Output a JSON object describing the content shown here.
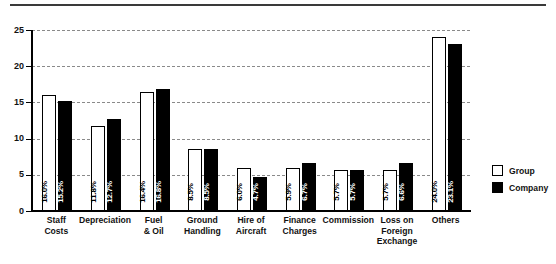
{
  "chart_data": {
    "type": "bar",
    "title": "",
    "subtitle": "",
    "xlabel": "",
    "ylabel": "",
    "ylim": [
      0,
      25
    ],
    "yticks": [
      0,
      5,
      10,
      15,
      20,
      25
    ],
    "grid": true,
    "legend_position": "right",
    "categories": [
      "Staff Costs",
      "Depreciation",
      "Fuel & Oil",
      "Ground Handling",
      "Hire of Aircraft",
      "Finance Charges",
      "Commission",
      "Loss on Foreign Exchange",
      "Others"
    ],
    "category_lines": [
      [
        "Staff",
        "Costs"
      ],
      [
        "Depreciation"
      ],
      [
        "Fuel",
        "& Oil"
      ],
      [
        "Ground",
        "Handling"
      ],
      [
        "Hire of",
        "Aircraft"
      ],
      [
        "Finance",
        "Charges"
      ],
      [
        "Commission"
      ],
      [
        "Loss on",
        "Foreign",
        "Exchange"
      ],
      [
        "Others"
      ]
    ],
    "series": [
      {
        "name": "Group",
        "color": "#ffffff",
        "values": [
          16.0,
          11.8,
          16.4,
          8.5,
          6.0,
          5.9,
          5.7,
          5.7,
          24.0
        ],
        "labels": [
          "16.0%",
          "11.8%",
          "16.4%",
          "8.5%",
          "6.0%",
          "5.9%",
          "5.7%",
          "5.7%",
          "24.0%"
        ]
      },
      {
        "name": "Company",
        "color": "#000000",
        "values": [
          15.2,
          12.7,
          16.8,
          8.5,
          4.7,
          6.7,
          5.7,
          6.6,
          23.1
        ],
        "labels": [
          "15.2%",
          "12.7%",
          "16.8%",
          "8.5%",
          "4.7%",
          "6.7%",
          "5.7%",
          "6.6%",
          "23.1%"
        ]
      }
    ]
  },
  "legend": {
    "items": [
      {
        "label": "Group",
        "swatch": "white"
      },
      {
        "label": "Company",
        "swatch": "black"
      }
    ]
  },
  "ytick_labels": [
    "0",
    "5",
    "10",
    "15",
    "20",
    "25"
  ]
}
